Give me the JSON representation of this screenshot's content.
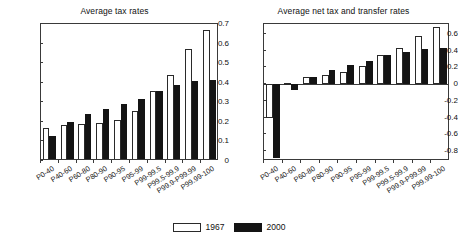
{
  "figure": {
    "legend": {
      "position": "bottom-center",
      "entries": [
        {
          "label": "1967",
          "swatch": "white-open",
          "color": "#ffffff"
        },
        {
          "label": "2000",
          "swatch": "black-filled",
          "color": "#141414"
        }
      ]
    }
  },
  "chart_data": [
    {
      "type": "bar",
      "title": "Average tax rates",
      "xlabel": "",
      "ylabel": "",
      "ylim": [
        0,
        0.7
      ],
      "yticks": [
        "0",
        "0.1",
        "0.2",
        "0.3",
        "0.4",
        "0.5",
        "0.6",
        "0.7"
      ],
      "ytick_values": [
        0,
        0.1,
        0.2,
        0.3,
        0.4,
        0.5,
        0.6,
        0.7
      ],
      "grid": false,
      "categories": [
        "P0-40",
        "P40-60",
        "P60-80",
        "P80-90",
        "P90-95",
        "P95-99",
        "P99-99.5",
        "P99.5-99.9",
        "P99.9-P99.99",
        "P99.99-100"
      ],
      "series": [
        {
          "name": "1967",
          "color": "#ffffff",
          "values": [
            0.17,
            0.185,
            0.19,
            0.195,
            0.21,
            0.255,
            0.36,
            0.44,
            0.57,
            0.67
          ]
        },
        {
          "name": "2000",
          "color": "#141414",
          "values": [
            0.13,
            0.2,
            0.24,
            0.265,
            0.29,
            0.315,
            0.36,
            0.39,
            0.41,
            0.415
          ]
        }
      ]
    },
    {
      "type": "bar",
      "title": "Average net tax and transfer rates",
      "xlabel": "",
      "ylabel": "",
      "ylim": [
        -0.92,
        0.72
      ],
      "yticks": [
        "-0.8",
        "-0.6",
        "-0.4",
        "-0.2",
        "0",
        "0.2",
        "0.4",
        "0.6"
      ],
      "ytick_values": [
        -0.8,
        -0.6,
        -0.4,
        -0.2,
        0,
        0.2,
        0.4,
        0.6
      ],
      "grid": false,
      "categories": [
        "P0-40",
        "P40-60",
        "P60-80",
        "P80-90",
        "P90-95",
        "P95-99",
        "P99-99.5",
        "P99.5-99.9",
        "P99.9-P99.99",
        "P99.99-100"
      ],
      "series": [
        {
          "name": "1967",
          "color": "#ffffff",
          "values": [
            -0.4,
            0.01,
            0.08,
            0.115,
            0.15,
            0.22,
            0.345,
            0.435,
            0.58,
            0.68
          ]
        },
        {
          "name": "2000",
          "color": "#141414",
          "values": [
            -0.88,
            -0.07,
            0.085,
            0.17,
            0.225,
            0.28,
            0.35,
            0.39,
            0.42,
            0.43
          ]
        }
      ]
    }
  ]
}
